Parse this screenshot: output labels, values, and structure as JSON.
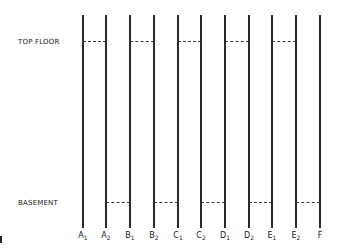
{
  "diagram": {
    "row_labels": {
      "top": "TOP FLOOR",
      "bottom": "BASEMENT"
    },
    "columns": [
      {
        "id": "A1",
        "base": "A",
        "sub": "1",
        "x": 83
      },
      {
        "id": "A2",
        "base": "A",
        "sub": "2",
        "x": 106
      },
      {
        "id": "B1",
        "base": "B",
        "sub": "1",
        "x": 130
      },
      {
        "id": "B2",
        "base": "B",
        "sub": "2",
        "x": 154
      },
      {
        "id": "C1",
        "base": "C",
        "sub": "1",
        "x": 178
      },
      {
        "id": "C2",
        "base": "C",
        "sub": "2",
        "x": 201
      },
      {
        "id": "D1",
        "base": "D",
        "sub": "1",
        "x": 225
      },
      {
        "id": "D2",
        "base": "D",
        "sub": "2",
        "x": 249
      },
      {
        "id": "E1",
        "base": "E",
        "sub": "1",
        "x": 272
      },
      {
        "id": "E2",
        "base": "E",
        "sub": "2",
        "x": 296
      },
      {
        "id": "F",
        "base": "F",
        "sub": "",
        "x": 320
      }
    ],
    "top_floor_connections": [
      [
        "A1",
        "A2"
      ],
      [
        "B1",
        "B2"
      ],
      [
        "C1",
        "C2"
      ],
      [
        "D1",
        "D2"
      ],
      [
        "E1",
        "E2"
      ]
    ],
    "basement_connections": [
      [
        "A2",
        "B1"
      ],
      [
        "B2",
        "C1"
      ],
      [
        "C2",
        "D1"
      ],
      [
        "D2",
        "E1"
      ],
      [
        "E2",
        "F"
      ]
    ]
  }
}
